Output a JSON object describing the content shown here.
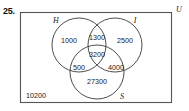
{
  "problem": {
    "number": "25."
  },
  "diagram": {
    "type": "venn-3-set",
    "universe": {
      "label": "U",
      "outside_value": "10200"
    },
    "sets": [
      {
        "key": "H",
        "label": "H",
        "position": "top-left"
      },
      {
        "key": "I",
        "label": "I",
        "position": "top-right"
      },
      {
        "key": "S",
        "label": "S",
        "position": "bottom"
      }
    ],
    "regions": [
      {
        "id": "H-only",
        "value": "1000",
        "sets": [
          "H"
        ]
      },
      {
        "id": "H-and-I",
        "value": "1300",
        "sets": [
          "H",
          "I"
        ]
      },
      {
        "id": "I-only",
        "value": "2500",
        "sets": [
          "I"
        ]
      },
      {
        "id": "H-I-S",
        "value": "3200",
        "sets": [
          "H",
          "I",
          "S"
        ]
      },
      {
        "id": "H-and-S",
        "value": "500",
        "sets": [
          "H",
          "S"
        ]
      },
      {
        "id": "I-and-S",
        "value": "4000",
        "sets": [
          "I",
          "S"
        ]
      },
      {
        "id": "S-only",
        "value": "27300",
        "sets": [
          "S"
        ]
      },
      {
        "id": "outside",
        "value": "10200",
        "sets": []
      }
    ]
  },
  "colors": {
    "stroke": "#3a3a3a",
    "rect_stroke": "#555555",
    "text": "#1a1a1a",
    "background": "#ffffff"
  }
}
